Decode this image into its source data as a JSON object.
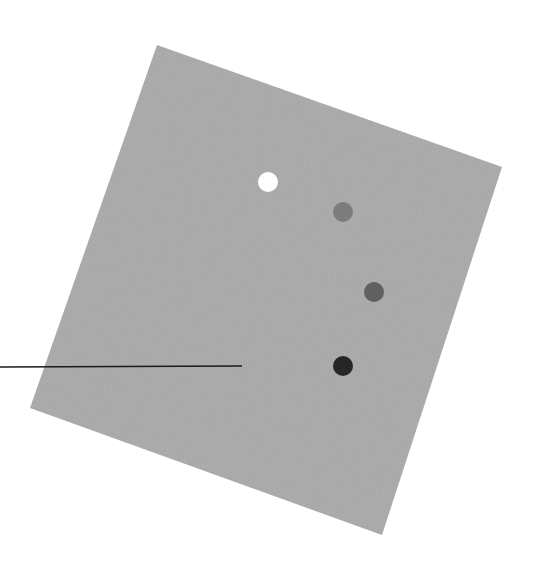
{
  "figure": {
    "background": "#ffffff",
    "panel": {
      "shape": "rotated-square",
      "fill": "#a9a9a9",
      "corners": [
        [
          157,
          45
        ],
        [
          502,
          167
        ],
        [
          382,
          535
        ],
        [
          30,
          408
        ]
      ]
    },
    "dots": [
      {
        "label": "dot-1",
        "cx": 268,
        "cy": 182,
        "r": 10,
        "fill": "#ffffff"
      },
      {
        "label": "dot-2",
        "cx": 343,
        "cy": 212,
        "r": 10,
        "fill": "#7d7d7d"
      },
      {
        "label": "dot-3",
        "cx": 374,
        "cy": 292,
        "r": 10,
        "fill": "#606060"
      },
      {
        "label": "dot-4",
        "cx": 343,
        "cy": 366,
        "r": 10,
        "fill": "#262626"
      }
    ],
    "leader_line": {
      "x1": 0,
      "y1": 367,
      "x2": 242,
      "y2": 366,
      "stroke": "#1a1a1a",
      "width": 1.6
    }
  }
}
